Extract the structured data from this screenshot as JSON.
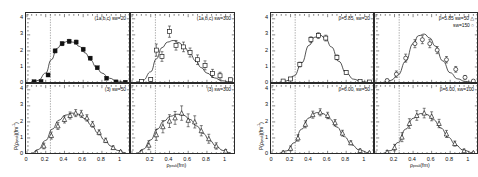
{
  "figure": {
    "axis": {
      "xlabel": "ρpeak(fm)",
      "ylabel": "P(ρpeak)(fm⁻¹)",
      "xticks": [
        "0",
        "0.2",
        "0.4",
        "0.6",
        "0.8",
        "1"
      ],
      "yticks": [
        "0",
        "1",
        "2",
        "3",
        "4"
      ],
      "xlim": [
        0,
        1.1
      ],
      "ylim": [
        0,
        4.3
      ],
      "refline_x": 0.25
    },
    "left_group": {
      "name": "left-figure",
      "panels": [
        {
          "id": "left-top-left",
          "label": "(1a,b,c) sw=20",
          "label2": "",
          "marker": "filled-square",
          "show_y_ticks": true,
          "show_x_ticks": true
        },
        {
          "id": "left-top-right",
          "label": "(1a,b,c) sw=300",
          "label2": "",
          "marker": "open-square",
          "show_y_ticks": false,
          "show_x_ticks": true
        },
        {
          "id": "left-bottom-left",
          "label": "(3) sw=50",
          "label2": "",
          "marker": "triangle",
          "show_y_ticks": true,
          "show_x_ticks": true
        },
        {
          "id": "left-bottom-right",
          "label": "(3) sw=300",
          "label2": "",
          "marker": "triangle",
          "show_y_ticks": false,
          "show_x_ticks": true
        }
      ]
    },
    "right_group": {
      "name": "right-figure",
      "panels": [
        {
          "id": "right-top-left",
          "label": "β=5.85, sw=20",
          "label2": "",
          "marker": "open-square",
          "show_y_ticks": true,
          "show_x_ticks": true
        },
        {
          "id": "right-top-right",
          "label": "β=5.85    sw=50  △",
          "label2": "sw=150  ○",
          "marker": "open-circle",
          "show_y_ticks": false,
          "show_x_ticks": true
        },
        {
          "id": "right-bottom-left",
          "label": "β=6.00, sw=50",
          "label2": "",
          "marker": "triangle",
          "show_y_ticks": true,
          "show_x_ticks": true
        },
        {
          "id": "right-bottom-right",
          "label": "β=6.00, sw=100",
          "label2": "",
          "marker": "triangle",
          "show_y_ticks": false,
          "show_x_ticks": true
        }
      ]
    }
  },
  "chart_data": [
    {
      "id": "left-top-left",
      "type": "scatter",
      "title": "(1a,b,c) sw=20",
      "xlabel": "ρpeak(fm)",
      "ylabel": "P(ρpeak)(fm⁻¹)",
      "xlim": [
        0,
        1.1
      ],
      "ylim": [
        0,
        4.3
      ],
      "marker": "filled-square",
      "refline_x": 0.25,
      "x": [
        0.075,
        0.15,
        0.225,
        0.3,
        0.375,
        0.45,
        0.525,
        0.6,
        0.675,
        0.75,
        0.85,
        0.95,
        1.05
      ],
      "y": [
        0.08,
        0.1,
        0.5,
        2.0,
        2.45,
        2.6,
        2.55,
        2.1,
        1.55,
        0.95,
        0.3,
        0.07,
        0.05
      ],
      "yerr": [
        0.04,
        0.05,
        0.1,
        0.12,
        0.12,
        0.12,
        0.12,
        0.12,
        0.1,
        0.08,
        0.06,
        0.04,
        0.04
      ],
      "curve": {
        "x": [
          0.05,
          0.12,
          0.2,
          0.26,
          0.32,
          0.38,
          0.44,
          0.5,
          0.56,
          0.62,
          0.68,
          0.74,
          0.8,
          0.88,
          0.96,
          1.05
        ],
        "y": [
          0.06,
          0.16,
          0.62,
          1.45,
          2.15,
          2.5,
          2.6,
          2.54,
          2.28,
          1.88,
          1.42,
          0.98,
          0.62,
          0.3,
          0.12,
          0.05
        ]
      }
    },
    {
      "id": "left-top-right",
      "type": "scatter",
      "title": "(1a,b,c) sw=300",
      "xlabel": "ρpeak(fm)",
      "ylabel": "P(ρpeak)(fm⁻¹)",
      "xlim": [
        0,
        1.1
      ],
      "ylim": [
        0,
        4.3
      ],
      "marker": "open-square",
      "refline_x": 0.25,
      "x": [
        0.1,
        0.2,
        0.26,
        0.32,
        0.4,
        0.47,
        0.55,
        0.62,
        0.7,
        0.78,
        0.86,
        0.94,
        1.05
      ],
      "y": [
        0.1,
        0.22,
        2.05,
        1.65,
        3.2,
        2.35,
        2.25,
        1.9,
        1.45,
        1.1,
        0.6,
        0.45,
        0.2
      ],
      "yerr": [
        0.07,
        0.1,
        0.38,
        0.3,
        0.35,
        0.3,
        0.3,
        0.28,
        0.3,
        0.28,
        0.25,
        0.22,
        0.1
      ],
      "curve": {
        "x": [
          0.05,
          0.12,
          0.2,
          0.26,
          0.32,
          0.38,
          0.44,
          0.5,
          0.56,
          0.62,
          0.68,
          0.74,
          0.8,
          0.88,
          0.96,
          1.05
        ],
        "y": [
          0.06,
          0.18,
          0.7,
          1.5,
          2.2,
          2.55,
          2.65,
          2.52,
          2.22,
          1.82,
          1.38,
          0.96,
          0.62,
          0.32,
          0.14,
          0.06
        ]
      }
    },
    {
      "id": "left-bottom-left",
      "type": "scatter",
      "title": "(3) sw=50",
      "xlabel": "ρpeak(fm)",
      "ylabel": "P(ρpeak)(fm⁻¹)",
      "xlim": [
        0,
        1.1
      ],
      "ylim": [
        0,
        4.3
      ],
      "marker": "triangle",
      "refline_x": 0.25,
      "x": [
        0.1,
        0.18,
        0.26,
        0.33,
        0.4,
        0.46,
        0.52,
        0.58,
        0.64,
        0.7,
        0.77,
        0.84,
        0.92,
        1.0
      ],
      "y": [
        0.1,
        0.5,
        1.15,
        1.75,
        2.15,
        2.4,
        2.55,
        2.5,
        2.25,
        1.85,
        1.35,
        0.85,
        0.4,
        0.15
      ],
      "yerr": [
        0.08,
        0.18,
        0.22,
        0.22,
        0.22,
        0.22,
        0.22,
        0.22,
        0.2,
        0.18,
        0.16,
        0.14,
        0.1,
        0.07
      ],
      "curve": {
        "x": [
          0.05,
          0.12,
          0.2,
          0.27,
          0.34,
          0.41,
          0.48,
          0.55,
          0.62,
          0.69,
          0.76,
          0.83,
          0.9,
          0.97,
          1.05
        ],
        "y": [
          0.05,
          0.28,
          0.85,
          1.55,
          2.1,
          2.42,
          2.55,
          2.48,
          2.2,
          1.78,
          1.3,
          0.85,
          0.48,
          0.22,
          0.08
        ]
      }
    },
    {
      "id": "left-bottom-right",
      "type": "scatter",
      "title": "(3) sw=300",
      "xlabel": "ρpeak(fm)",
      "ylabel": "P(ρpeak)(fm⁻¹)",
      "xlim": [
        0,
        1.1
      ],
      "ylim": [
        0,
        4.3
      ],
      "marker": "triangle",
      "refline_x": 0.25,
      "x": [
        0.1,
        0.18,
        0.26,
        0.33,
        0.4,
        0.46,
        0.53,
        0.6,
        0.67,
        0.74,
        0.82,
        0.9,
        1.0
      ],
      "y": [
        0.12,
        0.55,
        1.2,
        1.7,
        2.05,
        2.25,
        2.55,
        2.1,
        2.0,
        1.45,
        0.95,
        0.5,
        0.18
      ],
      "yerr": [
        0.1,
        0.28,
        0.35,
        0.38,
        0.4,
        0.4,
        0.45,
        0.4,
        0.38,
        0.32,
        0.28,
        0.2,
        0.1
      ],
      "curve": {
        "x": [
          0.05,
          0.12,
          0.2,
          0.27,
          0.34,
          0.41,
          0.48,
          0.55,
          0.62,
          0.69,
          0.76,
          0.83,
          0.9,
          0.97,
          1.05
        ],
        "y": [
          0.05,
          0.3,
          0.88,
          1.55,
          2.05,
          2.35,
          2.48,
          2.42,
          2.15,
          1.75,
          1.28,
          0.84,
          0.48,
          0.22,
          0.08
        ]
      }
    },
    {
      "id": "right-top-left",
      "type": "scatter",
      "title": "β=5.85, sw=20",
      "xlabel": "ρpeak(fm)",
      "ylabel": "P(ρpeak)(fm⁻¹)",
      "xlim": [
        0,
        1.1
      ],
      "ylim": [
        0,
        4.3
      ],
      "marker": "open-square",
      "refline_x": 0.25,
      "x": [
        0.12,
        0.2,
        0.3,
        0.42,
        0.5,
        0.58,
        0.7,
        0.8,
        0.95,
        1.05
      ],
      "y": [
        0.12,
        0.25,
        1.15,
        2.7,
        2.95,
        2.8,
        1.6,
        0.65,
        0.1,
        0.06
      ],
      "yerr": [
        0.07,
        0.1,
        0.15,
        0.18,
        0.18,
        0.18,
        0.15,
        0.1,
        0.05,
        0.04
      ],
      "curve": {
        "x": [
          0.08,
          0.16,
          0.24,
          0.32,
          0.4,
          0.46,
          0.52,
          0.58,
          0.64,
          0.72,
          0.8,
          0.88,
          0.96,
          1.05
        ],
        "y": [
          0.05,
          0.14,
          0.45,
          1.25,
          2.35,
          2.85,
          2.98,
          2.75,
          2.25,
          1.35,
          0.62,
          0.24,
          0.09,
          0.04
        ]
      }
    },
    {
      "id": "right-top-right",
      "type": "scatter",
      "title": "β=5.85  sw=50 / sw=150",
      "xlabel": "ρpeak(fm)",
      "ylabel": "P(ρpeak)(fm⁻¹)",
      "xlim": [
        0,
        1.1
      ],
      "ylim": [
        0,
        4.3
      ],
      "marker": "open-circle",
      "refline_x": 0.25,
      "x": [
        0.12,
        0.22,
        0.32,
        0.42,
        0.5,
        0.58,
        0.66,
        0.76,
        0.86,
        0.96,
        1.05
      ],
      "y": [
        0.15,
        0.55,
        1.55,
        2.45,
        2.7,
        2.45,
        2.05,
        1.45,
        0.85,
        0.35,
        0.12
      ],
      "yerr": [
        0.1,
        0.2,
        0.25,
        0.25,
        0.25,
        0.25,
        0.22,
        0.2,
        0.18,
        0.12,
        0.08
      ],
      "curve": {
        "x": [
          0.08,
          0.16,
          0.24,
          0.32,
          0.4,
          0.46,
          0.52,
          0.58,
          0.64,
          0.72,
          0.8,
          0.88,
          0.96,
          1.05
        ],
        "y": [
          0.05,
          0.16,
          0.52,
          1.35,
          2.45,
          2.95,
          3.05,
          2.8,
          2.3,
          1.38,
          0.64,
          0.26,
          0.1,
          0.04
        ]
      }
    },
    {
      "id": "right-bottom-left",
      "type": "scatter",
      "title": "β=6.00, sw=50",
      "xlabel": "ρpeak(fm)",
      "ylabel": "P(ρpeak)(fm⁻¹)",
      "xlim": [
        0,
        1.1
      ],
      "ylim": [
        0,
        4.3
      ],
      "marker": "triangle",
      "refline_x": 0.25,
      "x": [
        0.12,
        0.2,
        0.28,
        0.36,
        0.44,
        0.52,
        0.6,
        0.68,
        0.76,
        0.85,
        0.95,
        1.05
      ],
      "y": [
        0.1,
        0.35,
        1.0,
        1.85,
        2.45,
        2.6,
        2.4,
        1.95,
        1.3,
        0.7,
        0.22,
        0.08
      ],
      "yerr": [
        0.07,
        0.15,
        0.2,
        0.22,
        0.22,
        0.22,
        0.2,
        0.2,
        0.18,
        0.12,
        0.08,
        0.05
      ],
      "curve": {
        "x": [
          0.08,
          0.16,
          0.24,
          0.32,
          0.4,
          0.48,
          0.55,
          0.62,
          0.7,
          0.78,
          0.86,
          0.94,
          1.05
        ],
        "y": [
          0.05,
          0.2,
          0.7,
          1.55,
          2.25,
          2.58,
          2.52,
          2.2,
          1.68,
          1.08,
          0.58,
          0.25,
          0.07
        ]
      }
    },
    {
      "id": "right-bottom-right",
      "type": "scatter",
      "title": "β=6.00, sw=100",
      "xlabel": "ρpeak(fm)",
      "ylabel": "P(ρpeak)(fm⁻¹)",
      "xlim": [
        0,
        1.1
      ],
      "ylim": [
        0,
        4.3
      ],
      "marker": "triangle",
      "refline_x": 0.25,
      "x": [
        0.12,
        0.2,
        0.28,
        0.36,
        0.44,
        0.52,
        0.6,
        0.68,
        0.76,
        0.85,
        0.95,
        1.05
      ],
      "y": [
        0.12,
        0.4,
        1.05,
        1.9,
        2.4,
        2.55,
        2.35,
        1.9,
        1.25,
        0.65,
        0.2,
        0.08
      ],
      "yerr": [
        0.1,
        0.2,
        0.28,
        0.3,
        0.3,
        0.3,
        0.28,
        0.26,
        0.22,
        0.16,
        0.1,
        0.06
      ],
      "curve": {
        "x": [
          0.08,
          0.16,
          0.24,
          0.32,
          0.4,
          0.48,
          0.55,
          0.62,
          0.7,
          0.78,
          0.86,
          0.94,
          1.05
        ],
        "y": [
          0.05,
          0.22,
          0.72,
          1.55,
          2.22,
          2.52,
          2.46,
          2.14,
          1.62,
          1.04,
          0.56,
          0.24,
          0.07
        ]
      }
    }
  ]
}
